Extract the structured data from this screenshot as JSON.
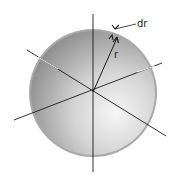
{
  "diagram": {
    "type": "spherical-shell",
    "labels": {
      "radius": "r",
      "shell_thickness": "dr"
    },
    "colors": {
      "sphere_light": "#f4f4f4",
      "sphere_dark": "#8e8e8e",
      "rim": "#a8a8a8",
      "axis": "#1a1a1a"
    },
    "elements": [
      "sphere",
      "x-axis",
      "y-axis",
      "z-axis",
      "radius-arrow",
      "dr-marker"
    ]
  }
}
